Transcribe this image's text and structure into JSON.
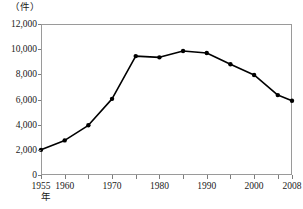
{
  "chart_data": {
    "type": "line",
    "title": "",
    "subtitle": "",
    "xlabel": "年",
    "ylabel": "（件）",
    "y_unit_label": "（件）",
    "x_unit_label": "年",
    "grid": false,
    "legend": false,
    "legend_position": "none",
    "xlim": [
      1955,
      2008
    ],
    "ylim": [
      0,
      12000
    ],
    "y_ticks": [
      0,
      2000,
      4000,
      6000,
      8000,
      10000,
      12000
    ],
    "y_tick_labels": [
      "0",
      "2,000",
      "4,000",
      "6,000",
      "8,000",
      "10,000",
      "12,000"
    ],
    "x_ticks": [
      1955,
      1960,
      1965,
      1970,
      1975,
      1980,
      1985,
      1990,
      1995,
      2000,
      2005,
      2008
    ],
    "x_tick_labels_shown": [
      "1955",
      "1960",
      "1970",
      "1980",
      "1990",
      "2000",
      "2008"
    ],
    "x": [
      1955,
      1960,
      1965,
      1970,
      1975,
      1980,
      1985,
      1990,
      1995,
      2000,
      2005,
      2008
    ],
    "values": [
      2000,
      2750,
      3950,
      6050,
      9450,
      9350,
      9850,
      9700,
      8800,
      7950,
      6350,
      5900
    ],
    "marker": "filled-circle",
    "line_color": "#000000",
    "marker_color": "#000000"
  },
  "axes": {
    "frame_color": "#9a9a9a",
    "tick_color": "#7d7d7d"
  }
}
